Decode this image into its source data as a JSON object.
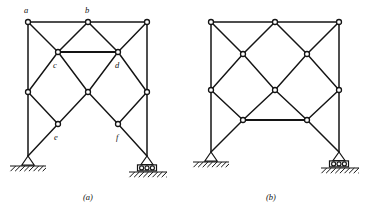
{
  "figure": {
    "stroke_color": "#141414",
    "background_color": "#ffffff",
    "joint_fill": "#ffffff"
  },
  "panels": [
    {
      "id": "a",
      "caption": "(a)",
      "caption_x": 88,
      "caption_y": 200,
      "has_labels": true,
      "horizontal_member_level": "upper",
      "nodes": [
        {
          "id": "a",
          "label": "a",
          "x": 28,
          "y": 22,
          "label_x": 24,
          "label_y": 13,
          "labeled": true
        },
        {
          "id": "b",
          "label": "b",
          "x": 88,
          "y": 22,
          "label_x": 85,
          "label_y": 13,
          "labeled": true
        },
        {
          "id": "g",
          "label": "",
          "x": 147,
          "y": 22,
          "label_x": 0,
          "label_y": 0,
          "labeled": false
        },
        {
          "id": "c",
          "label": "c",
          "x": 58,
          "y": 52,
          "label_x": 53,
          "label_y": 68,
          "labeled": true
        },
        {
          "id": "d",
          "label": "d",
          "x": 118,
          "y": 52,
          "label_x": 115,
          "label_y": 68,
          "labeled": true
        },
        {
          "id": "hl",
          "label": "",
          "x": 28,
          "y": 92,
          "label_x": 0,
          "label_y": 0,
          "labeled": false
        },
        {
          "id": "m",
          "label": "",
          "x": 88,
          "y": 92,
          "label_x": 0,
          "label_y": 0,
          "labeled": false
        },
        {
          "id": "hr",
          "label": "",
          "x": 147,
          "y": 92,
          "label_x": 0,
          "label_y": 0,
          "labeled": false
        },
        {
          "id": "e",
          "label": "e",
          "x": 58,
          "y": 124,
          "label_x": 54,
          "label_y": 140,
          "labeled": true
        },
        {
          "id": "f",
          "label": "f",
          "x": 118,
          "y": 124,
          "label_x": 116,
          "label_y": 140,
          "labeled": true
        }
      ],
      "members": [
        {
          "from": "a",
          "to": "b",
          "weight": "normal"
        },
        {
          "from": "b",
          "to": "g",
          "weight": "normal"
        },
        {
          "from": "a",
          "to": "c",
          "weight": "normal"
        },
        {
          "from": "b",
          "to": "c",
          "weight": "normal"
        },
        {
          "from": "b",
          "to": "d",
          "weight": "normal"
        },
        {
          "from": "g",
          "to": "d",
          "weight": "normal"
        },
        {
          "from": "c",
          "to": "d",
          "weight": "heavy"
        },
        {
          "from": "c",
          "to": "hl",
          "weight": "normal"
        },
        {
          "from": "c",
          "to": "m",
          "weight": "normal"
        },
        {
          "from": "d",
          "to": "m",
          "weight": "normal"
        },
        {
          "from": "d",
          "to": "hr",
          "weight": "normal"
        },
        {
          "from": "hl",
          "to": "e",
          "weight": "normal"
        },
        {
          "from": "m",
          "to": "e",
          "weight": "normal"
        },
        {
          "from": "m",
          "to": "f",
          "weight": "normal"
        },
        {
          "from": "hr",
          "to": "f",
          "weight": "normal"
        }
      ],
      "columns": [
        {
          "from_x": 28,
          "from_y": 22,
          "to_x": 28,
          "to_y": 92
        },
        {
          "from_x": 28,
          "from_y": 92,
          "to_x": 28,
          "to_y": 156
        },
        {
          "from_x": 147,
          "from_y": 22,
          "to_x": 147,
          "to_y": 92
        },
        {
          "from_x": 147,
          "from_y": 92,
          "to_x": 147,
          "to_y": 156
        }
      ],
      "legs": [
        {
          "from_x": 58,
          "from_y": 124,
          "to_x": 28,
          "to_y": 156
        },
        {
          "from_x": 118,
          "from_y": 124,
          "to_x": 147,
          "to_y": 156
        }
      ],
      "supports": [
        {
          "type": "pinned",
          "x": 28,
          "y": 156,
          "ground_y": 166,
          "ground_width": 36
        },
        {
          "type": "roller",
          "x": 147,
          "y": 156,
          "ground_y": 172,
          "ground_width": 38
        }
      ]
    },
    {
      "id": "b",
      "caption": "(b)",
      "caption_x": 271,
      "caption_y": 200,
      "has_labels": false,
      "horizontal_member_level": "lower",
      "nodes": [
        {
          "id": "a",
          "label": "",
          "x": 211,
          "y": 22,
          "label_x": 0,
          "label_y": 0,
          "labeled": false
        },
        {
          "id": "b",
          "label": "",
          "x": 275,
          "y": 22,
          "label_x": 0,
          "label_y": 0,
          "labeled": false
        },
        {
          "id": "g",
          "label": "",
          "x": 339,
          "y": 22,
          "label_x": 0,
          "label_y": 0,
          "labeled": false
        },
        {
          "id": "c",
          "label": "",
          "x": 243,
          "y": 54,
          "label_x": 0,
          "label_y": 0,
          "labeled": false
        },
        {
          "id": "d",
          "label": "",
          "x": 307,
          "y": 54,
          "label_x": 0,
          "label_y": 0,
          "labeled": false
        },
        {
          "id": "hl",
          "label": "",
          "x": 211,
          "y": 90,
          "label_x": 0,
          "label_y": 0,
          "labeled": false
        },
        {
          "id": "m",
          "label": "",
          "x": 275,
          "y": 90,
          "label_x": 0,
          "label_y": 0,
          "labeled": false
        },
        {
          "id": "hr",
          "label": "",
          "x": 339,
          "y": 90,
          "label_x": 0,
          "label_y": 0,
          "labeled": false
        },
        {
          "id": "e",
          "label": "",
          "x": 243,
          "y": 120,
          "label_x": 0,
          "label_y": 0,
          "labeled": false
        },
        {
          "id": "f",
          "label": "",
          "x": 307,
          "y": 120,
          "label_x": 0,
          "label_y": 0,
          "labeled": false
        }
      ],
      "members": [
        {
          "from": "a",
          "to": "b",
          "weight": "normal"
        },
        {
          "from": "b",
          "to": "g",
          "weight": "normal"
        },
        {
          "from": "a",
          "to": "c",
          "weight": "normal"
        },
        {
          "from": "b",
          "to": "c",
          "weight": "normal"
        },
        {
          "from": "b",
          "to": "d",
          "weight": "normal"
        },
        {
          "from": "g",
          "to": "d",
          "weight": "normal"
        },
        {
          "from": "c",
          "to": "hl",
          "weight": "normal"
        },
        {
          "from": "c",
          "to": "m",
          "weight": "normal"
        },
        {
          "from": "d",
          "to": "m",
          "weight": "normal"
        },
        {
          "from": "d",
          "to": "hr",
          "weight": "normal"
        },
        {
          "from": "hl",
          "to": "e",
          "weight": "normal"
        },
        {
          "from": "m",
          "to": "e",
          "weight": "normal"
        },
        {
          "from": "m",
          "to": "f",
          "weight": "normal"
        },
        {
          "from": "hr",
          "to": "f",
          "weight": "normal"
        },
        {
          "from": "e",
          "to": "f",
          "weight": "heavy"
        }
      ],
      "columns": [
        {
          "from_x": 211,
          "from_y": 22,
          "to_x": 211,
          "to_y": 90
        },
        {
          "from_x": 211,
          "from_y": 90,
          "to_x": 211,
          "to_y": 152
        },
        {
          "from_x": 339,
          "from_y": 22,
          "to_x": 339,
          "to_y": 90
        },
        {
          "from_x": 339,
          "from_y": 90,
          "to_x": 339,
          "to_y": 152
        }
      ],
      "legs": [
        {
          "from_x": 243,
          "from_y": 120,
          "to_x": 211,
          "to_y": 152
        },
        {
          "from_x": 307,
          "from_y": 120,
          "to_x": 339,
          "to_y": 152
        }
      ],
      "supports": [
        {
          "type": "pinned",
          "x": 211,
          "y": 152,
          "ground_y": 162,
          "ground_width": 36
        },
        {
          "type": "roller",
          "x": 339,
          "y": 152,
          "ground_y": 168,
          "ground_width": 38
        }
      ]
    }
  ],
  "legend": {
    "pinned_support_name": "pinned-support",
    "roller_support_name": "roller-support",
    "joint_name": "truss-joint",
    "member_name": "truss-member"
  }
}
